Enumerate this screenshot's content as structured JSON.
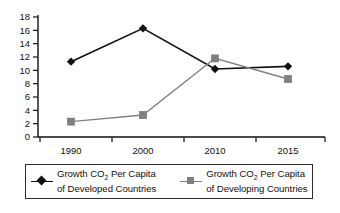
{
  "chart_data": {
    "type": "line",
    "title": "",
    "subtitle": "",
    "xlabel": "",
    "ylabel": "",
    "categories": [
      "1990",
      "2000",
      "2010",
      "2015"
    ],
    "x_tick_labels": [
      "1990",
      "2000",
      "2010",
      "2015"
    ],
    "y_tick_labels": [
      "0",
      "2",
      "4",
      "6",
      "8",
      "10",
      "12",
      "14",
      "16",
      "18"
    ],
    "y_ticks": [
      0,
      2,
      4,
      6,
      8,
      10,
      12,
      14,
      16,
      18
    ],
    "ylim": [
      0,
      18
    ],
    "grid": false,
    "legend_position": "bottom",
    "series": [
      {
        "name": "Growth CO2 Per Capita of Developed Countries",
        "name_line1": "Growth CO",
        "name_sub": "2",
        "name_line1_tail": " Per Capita",
        "name_line2": "of Developed Countries",
        "marker": "diamond",
        "color": "#111111",
        "values": [
          11.3,
          16.3,
          10.2,
          10.6
        ]
      },
      {
        "name": "Growth CO2 Per Capita of Developing Countries",
        "name_line1": "Growth CO",
        "name_sub": "2",
        "name_line1_tail": " Per Capita",
        "name_line2": "of Developing Countries",
        "marker": "square",
        "color": "#808080",
        "values": [
          2.3,
          3.3,
          11.8,
          8.7
        ]
      }
    ]
  },
  "axis": {
    "axis_color": "#111111",
    "tick_color": "#111111"
  }
}
